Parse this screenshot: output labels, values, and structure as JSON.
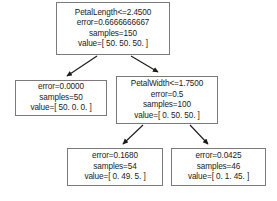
{
  "diagram": {
    "type": "decision-tree",
    "background_color": "#ffffff",
    "node_border_color": "#7a7a7a",
    "edge_color": "#1a1a1a",
    "text_color": "#1a1a1a"
  },
  "nodes": {
    "root": {
      "id": "root",
      "condition": "PetalLength<=2.4500",
      "error": "error=0.6666666667",
      "samples": "samples=150",
      "value": "value=[ 50. 50. 50. ]"
    },
    "left": {
      "id": "left",
      "error": "error=0.0000",
      "samples": "samples=50",
      "value": "value=[ 50. 0. 0. ]"
    },
    "right": {
      "id": "right",
      "condition": "PetalWidth<=1.7500",
      "error": "error=0.5",
      "samples": "samples=100",
      "value": "value=[ 0. 50. 50. ]"
    },
    "leaf_left": {
      "id": "leaf_left",
      "error": "error=0.1680",
      "samples": "samples=54",
      "value": "value=[ 0. 49. 5. ]"
    },
    "leaf_right": {
      "id": "leaf_right",
      "error": "error=0.0425",
      "samples": "samples=46",
      "value": "value=[ 0. 1. 45. ]"
    }
  },
  "edges": [
    {
      "from": "root",
      "to": "left"
    },
    {
      "from": "root",
      "to": "right"
    },
    {
      "from": "right",
      "to": "leaf_left"
    },
    {
      "from": "right",
      "to": "leaf_right"
    }
  ]
}
